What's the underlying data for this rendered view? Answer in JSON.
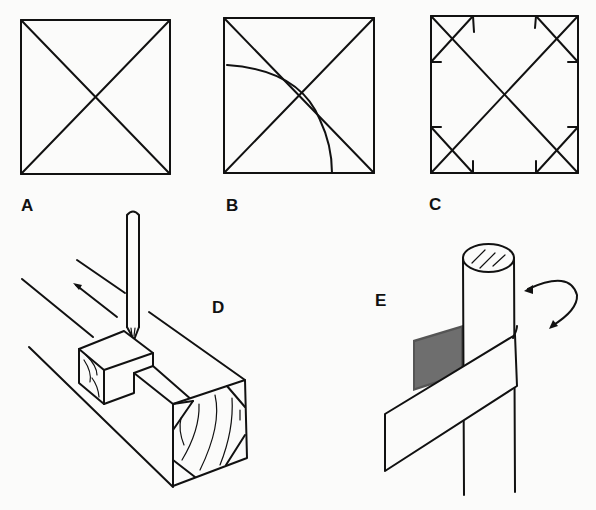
{
  "figure": {
    "panels": [
      {
        "id": "A",
        "label": "A",
        "description": "Square with both diagonals drawn"
      },
      {
        "id": "B",
        "label": "B",
        "description": "Square with diagonals and a quarter-circle arc centered at lower-left corner passing through the center"
      },
      {
        "id": "C",
        "label": "C",
        "description": "Square with diagonals and short chamfer lines cutting off each corner, with tick marks"
      },
      {
        "id": "D",
        "label": "D",
        "description": "Square wooden stock in a V-cradle with pencil gauge marking chamfer lines; end grain shows octagon layout; arrow shows direction of travel"
      },
      {
        "id": "E",
        "label": "E",
        "description": "Round dowel being rotated while wrapped with a strip of sandpaper; curved arrow indicates rotation"
      }
    ]
  },
  "colors": {
    "ink": "#111111",
    "paper": "#fbfbfa"
  }
}
